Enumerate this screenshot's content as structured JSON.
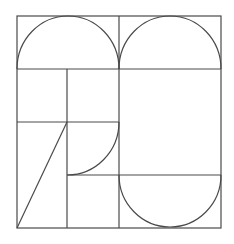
{
  "diagram": {
    "type": "geometric-composition",
    "stroke_color": "#4a4a4a",
    "background": "#ffffff",
    "frame": {
      "x": 17,
      "y": 16,
      "width": 204,
      "height": 212
    },
    "lines": [
      {
        "name": "top-band-divider",
        "x1": 17,
        "y1": 69,
        "x2": 221,
        "y2": 69
      },
      {
        "name": "center-vertical",
        "x1": 119,
        "y1": 16,
        "x2": 119,
        "y2": 228
      },
      {
        "name": "left-inner-vertical",
        "x1": 67,
        "y1": 69,
        "x2": 67,
        "y2": 228
      },
      {
        "name": "left-mid-horizontal",
        "x1": 17,
        "y1": 122,
        "x2": 119,
        "y2": 122
      },
      {
        "name": "right-lower-horizontal",
        "x1": 67,
        "y1": 175,
        "x2": 221,
        "y2": 175
      },
      {
        "name": "diagonal",
        "x1": 17,
        "y1": 228,
        "x2": 67,
        "y2": 122
      }
    ],
    "arcs": [
      {
        "name": "top-left-semicircle",
        "d": "M17 69 A51 53 0 0 1 119 69"
      },
      {
        "name": "top-right-semicircle",
        "d": "M119 69 A51 53 0 0 1 221 69"
      },
      {
        "name": "quarter-arc",
        "d": "M119 122 A52 53 0 0 1 67 175"
      },
      {
        "name": "bottom-right-semicircle",
        "d": "M119 175 A51 52 0 0 0 221 175"
      }
    ]
  }
}
